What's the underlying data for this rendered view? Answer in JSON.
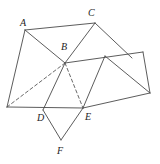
{
  "figure": {
    "kind": "geometry-net-diagram",
    "width": 160,
    "height": 164,
    "background_color": "#ffffff",
    "line_color": "#4a4a4a",
    "dashed_line_color": "#585858",
    "label_color": "#1d1d1d"
  },
  "labels": {
    "a": "A",
    "b": "B",
    "c": "C",
    "d": "D",
    "e": "E",
    "f": "F"
  },
  "label_positions": {
    "a": {
      "x": 20,
      "y": 18
    },
    "b": {
      "x": 61,
      "y": 42
    },
    "c": {
      "x": 88,
      "y": 8
    },
    "d": {
      "x": 37,
      "y": 113
    },
    "e": {
      "x": 85,
      "y": 112
    },
    "f": {
      "x": 57,
      "y": 146
    }
  },
  "points": {
    "A": {
      "x": 25,
      "y": 30
    },
    "B": {
      "x": 65,
      "y": 63
    },
    "C": {
      "x": 95,
      "y": 23
    },
    "D": {
      "x": 43,
      "y": 110
    },
    "E": {
      "x": 83,
      "y": 108
    },
    "F": {
      "x": 61,
      "y": 140
    },
    "G": {
      "x": 7,
      "y": 107
    },
    "H": {
      "x": 132,
      "y": 58
    },
    "I": {
      "x": 143,
      "y": 52
    },
    "J": {
      "x": 150,
      "y": 93
    },
    "K": {
      "x": 105,
      "y": 56
    }
  },
  "edges_solid": [
    {
      "name": "A-C",
      "from": "A",
      "to": "C"
    },
    {
      "name": "A-B",
      "from": "A",
      "to": "B"
    },
    {
      "name": "A-G",
      "from": "A",
      "to": "G"
    },
    {
      "name": "C-B",
      "from": "C",
      "to": "B"
    },
    {
      "name": "C-H",
      "from": "C",
      "to": "H"
    },
    {
      "name": "B-I",
      "from": "B",
      "to": "I"
    },
    {
      "name": "B-D",
      "from": "B",
      "to": "D"
    },
    {
      "name": "G-E",
      "from": "G",
      "to": "E"
    },
    {
      "name": "I-J",
      "from": "I",
      "to": "J"
    },
    {
      "name": "E-J",
      "from": "E",
      "to": "J"
    },
    {
      "name": "K-E",
      "from": "K",
      "to": "E"
    },
    {
      "name": "K-J",
      "from": "K",
      "to": "J"
    },
    {
      "name": "D-F",
      "from": "D",
      "to": "F"
    },
    {
      "name": "F-E",
      "from": "F",
      "to": "E"
    }
  ],
  "edges_dashed": [
    {
      "name": "B-G",
      "from": "B",
      "to": "G"
    },
    {
      "name": "B-E",
      "from": "B",
      "to": "E"
    }
  ]
}
